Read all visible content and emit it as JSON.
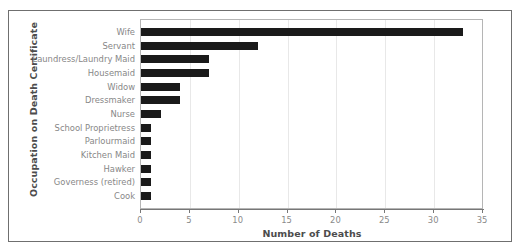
{
  "chart_data": {
    "type": "bar",
    "orientation": "horizontal",
    "title": "",
    "xlabel": "Number of Deaths",
    "ylabel": "Occupation on Death Certificate",
    "categories": [
      "Wife",
      "Servant",
      "Laundress/Laundry Maid",
      "Housemaid",
      "Widow",
      "Dressmaker",
      "Nurse",
      "School Proprietress",
      "Parlourmaid",
      "Kitchen Maid",
      "Hawker",
      "Governess (retired)",
      "Cook"
    ],
    "values": [
      33,
      12,
      7,
      7,
      4,
      4,
      2,
      1,
      1,
      1,
      1,
      1,
      1
    ],
    "xlim": [
      0,
      35
    ],
    "xticks": [
      0,
      5,
      10,
      15,
      20,
      25,
      30,
      35
    ],
    "xtick_labels": [
      "0",
      "5",
      "10",
      "15",
      "20",
      "25",
      "30",
      "35"
    ],
    "grid": true,
    "grid_axis": "x",
    "legend": "none",
    "bar_color": "#1a1a1a",
    "label_color": "#878787",
    "axis_title_color": "#4c4c4c"
  }
}
